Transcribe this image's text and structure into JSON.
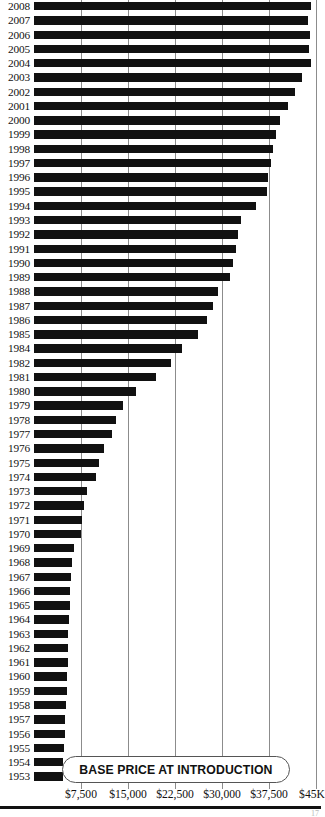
{
  "title": "BASE PRICE AT INTRODUCTION",
  "page_number": "17",
  "chart_data": {
    "type": "bar",
    "orientation": "horizontal",
    "title": "BASE PRICE AT INTRODUCTION",
    "xlabel": "",
    "ylabel": "",
    "xlim": [
      0,
      45000
    ],
    "grid": true,
    "legend": null,
    "bar_color": "#111111",
    "gridline_color": "#8c8c8c",
    "xticks": [
      7500,
      15000,
      22500,
      30000,
      37500,
      45000
    ],
    "xtick_labels": [
      "$7,500",
      "$15,000",
      "$22,500",
      "$30,000",
      "$37,500",
      "$45K"
    ],
    "categories": [
      "2008",
      "2007",
      "2006",
      "2005",
      "2004",
      "2003",
      "2002",
      "2001",
      "2000",
      "1999",
      "1998",
      "1997",
      "1996",
      "1995",
      "1994",
      "1993",
      "1992",
      "1991",
      "1990",
      "1989",
      "1988",
      "1987",
      "1986",
      "1985",
      "1984",
      "1982",
      "1981",
      "1980",
      "1979",
      "1978",
      "1977",
      "1976",
      "1975",
      "1974",
      "1973",
      "1972",
      "1971",
      "1970",
      "1969",
      "1968",
      "1967",
      "1966",
      "1965",
      "1964",
      "1963",
      "1962",
      "1961",
      "1960",
      "1959",
      "1958",
      "1957",
      "1956",
      "1955",
      "1954",
      "1953"
    ],
    "values": [
      44200,
      43800,
      44000,
      43900,
      44200,
      42800,
      41600,
      40600,
      39300,
      38600,
      38100,
      37800,
      37300,
      37200,
      35400,
      33100,
      32600,
      32300,
      31800,
      31300,
      29400,
      28500,
      27600,
      26100,
      23600,
      21800,
      19400,
      16200,
      14200,
      13100,
      12400,
      11200,
      10400,
      9900,
      8500,
      8000,
      7700,
      7500,
      6400,
      6100,
      5900,
      5800,
      5700,
      5600,
      5500,
      5500,
      5400,
      5300,
      5200,
      5100,
      5000,
      4900,
      4800,
      4700,
      4600
    ],
    "note": "Values are base prices in US dollars, read from the bar lengths against the gridlines."
  }
}
